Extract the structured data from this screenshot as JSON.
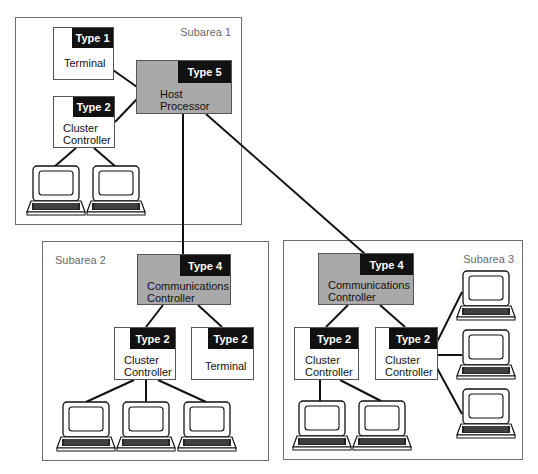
{
  "diagram": {
    "colors": {
      "line": "#111111",
      "gray_node": "#a9a9a9",
      "tag_bg": "#111111",
      "border": "#6e6e6e"
    },
    "subareas": [
      {
        "id": "subarea-1",
        "label": "Subarea 1"
      },
      {
        "id": "subarea-2",
        "label": "Subarea 2"
      },
      {
        "id": "subarea-3",
        "label": "Subarea 3"
      }
    ],
    "nodes": {
      "s1_terminal": {
        "type": "Type 1",
        "name": "Terminal"
      },
      "s1_cluster": {
        "type": "Type 2",
        "name": "Cluster\nController"
      },
      "s1_host": {
        "type": "Type 5",
        "name": "Host\nProcessor"
      },
      "s2_comm": {
        "type": "Type 4",
        "name": "Communications\nController"
      },
      "s2_cluster": {
        "type": "Type 2",
        "name": "Cluster\nController"
      },
      "s2_terminal": {
        "type": "Type 2",
        "name": "Terminal"
      },
      "s3_comm": {
        "type": "Type 4",
        "name": "Communications\nController"
      },
      "s3_cluster_left": {
        "type": "Type 2",
        "name": "Cluster\nController"
      },
      "s3_cluster_right": {
        "type": "Type 2",
        "name": "Cluster\nController"
      }
    },
    "terminal_icons": [
      "computer-terminal-icon"
    ]
  }
}
